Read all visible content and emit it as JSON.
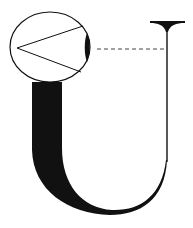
{
  "diagram": {
    "title": "",
    "colors": {
      "ink": "#111111",
      "background": "#ffffff",
      "dash": "#444444"
    },
    "elements": {
      "magnifier": {
        "shape": "ellipse",
        "cx": 50,
        "cy": 47,
        "rx": 40,
        "ry": 35,
        "contents": "pen-nib angle wedge"
      },
      "nib_wedge": {
        "apex": [
          17,
          48
        ],
        "upper_end": [
          83,
          26
        ],
        "lower_end": [
          81,
          72
        ]
      },
      "leader_line": {
        "style": "dashed",
        "from": [
          97,
          49
        ],
        "to": [
          164,
          49
        ]
      },
      "letter": {
        "glyph": "U",
        "thick_stroke": "left",
        "thin_stroke": "right",
        "serif": "top-right flared"
      }
    }
  }
}
